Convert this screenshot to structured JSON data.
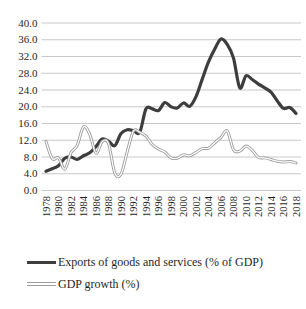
{
  "figure": {
    "background": "#ffffff"
  },
  "colors": {
    "exports_line": "#3d3d3d",
    "gdp_growth_line_outer": "#9e9e9e",
    "gdp_growth_line_core": "#ffffff",
    "gridline": "#c8c8c8",
    "text": "#1f1f1f"
  },
  "legend": {
    "items": [
      {
        "label": "Exports of goods and services (% of GDP)"
      },
      {
        "label": "GDP growth (%)"
      }
    ]
  },
  "chart_data": {
    "type": "line",
    "title": "",
    "xlabel": "",
    "ylabel": "",
    "grid": "horizontal",
    "legend_position": "bottom-left",
    "ylim": [
      0,
      40
    ],
    "ytick_step": 4,
    "y_tick_labels": [
      "40.0",
      "36.0",
      "32.0",
      "28.0",
      "24.0",
      "20.0",
      "16.0",
      "12.0",
      "8.0",
      "4.0",
      "0.0"
    ],
    "x_tick_labels": [
      "1978",
      "1980",
      "1982",
      "1984",
      "1986",
      "1988",
      "1990",
      "1992",
      "1994",
      "1996",
      "1998",
      "2000",
      "2002",
      "2004",
      "2006",
      "2008",
      "2010",
      "2012",
      "2014",
      "2016",
      "2018"
    ],
    "x": [
      1978,
      1979,
      1980,
      1981,
      1982,
      1983,
      1984,
      1985,
      1986,
      1987,
      1988,
      1989,
      1990,
      1991,
      1992,
      1993,
      1994,
      1995,
      1996,
      1997,
      1998,
      1999,
      2000,
      2001,
      2002,
      2003,
      2004,
      2005,
      2006,
      2007,
      2008,
      2009,
      2010,
      2011,
      2012,
      2013,
      2014,
      2015,
      2016,
      2017,
      2018
    ],
    "series": [
      {
        "name": "Exports of goods and services (% of GDP)",
        "style": "solid-thick",
        "color": "#3d3d3d",
        "values": [
          4.6,
          5.2,
          5.9,
          7.7,
          8.0,
          7.4,
          8.3,
          9.0,
          10.5,
          12.3,
          11.8,
          10.7,
          13.6,
          14.5,
          14.3,
          13.9,
          19.5,
          19.5,
          19.1,
          21.0,
          20.0,
          19.7,
          20.9,
          20.1,
          22.4,
          26.6,
          30.7,
          33.8,
          36.2,
          34.9,
          31.6,
          24.5,
          27.4,
          26.5,
          25.4,
          24.5,
          23.5,
          21.4,
          19.6,
          19.8,
          18.4
        ]
      },
      {
        "name": "GDP growth (%)",
        "style": "double-line",
        "color": "#9e9e9e",
        "values": [
          11.7,
          7.6,
          7.8,
          5.1,
          9.0,
          10.8,
          15.2,
          13.4,
          8.9,
          11.7,
          11.2,
          4.2,
          3.9,
          9.3,
          14.2,
          13.9,
          13.0,
          11.0,
          9.9,
          9.2,
          7.8,
          7.7,
          8.5,
          8.3,
          9.1,
          10.0,
          10.1,
          11.4,
          12.7,
          14.2,
          9.7,
          9.4,
          10.6,
          9.6,
          7.9,
          7.8,
          7.4,
          7.0,
          6.8,
          6.9,
          6.6
        ]
      }
    ]
  }
}
